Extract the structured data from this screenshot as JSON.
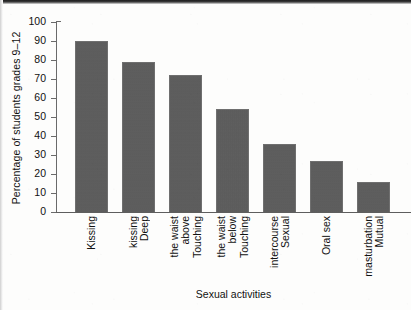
{
  "chart_data": {
    "type": "bar",
    "title": "",
    "xlabel": "Sexual activities",
    "ylabel": "Percentage of students grades 9–12",
    "categories": [
      "Kissing",
      "Deep kissing",
      "Touching above the waist",
      "Touching below the waist",
      "Sexual intercourse",
      "Oral sex",
      "Mutual masturbation"
    ],
    "category_lines": [
      [
        "Kissing"
      ],
      [
        "Deep",
        "kissing"
      ],
      [
        "Touching",
        "above",
        "the waist"
      ],
      [
        "Touching",
        "below",
        "the waist"
      ],
      [
        "Sexual",
        "intercourse"
      ],
      [
        "Oral sex"
      ],
      [
        "Mutual",
        "masturbation"
      ]
    ],
    "values": [
      90,
      79,
      72,
      54,
      36,
      27,
      16
    ],
    "ylim": [
      0,
      100
    ],
    "yticks": [
      0,
      10,
      20,
      30,
      40,
      50,
      60,
      70,
      80,
      90,
      100
    ],
    "ytick_labels": [
      "0",
      "10",
      "20",
      "30",
      "40",
      "50",
      "60",
      "70",
      "80",
      "90",
      "100"
    ],
    "grid": false,
    "legend": null,
    "bar_color": "#5b5b5b",
    "bar_edge_color": "#6f6f6f",
    "axis_color": "#5e5e5e",
    "text_color": "#111111",
    "background_color": "#fdfdfc"
  }
}
